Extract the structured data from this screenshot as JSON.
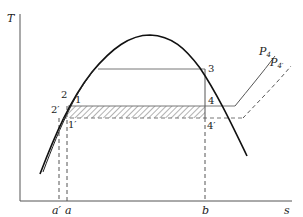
{
  "axes": {
    "y_label": "T",
    "x_label": "s",
    "x_ticks": [
      {
        "id": "a-prime",
        "label": "a′"
      },
      {
        "id": "a",
        "label": "a"
      },
      {
        "id": "b",
        "label": "b"
      }
    ]
  },
  "states": {
    "p1": "1",
    "p1p": "1′",
    "p2": "2",
    "p2p": "2′",
    "p3": "3",
    "p4": "4",
    "p4p": "4′"
  },
  "isobars": {
    "p4": {
      "base": "P",
      "sub": "4",
      "style": "solid"
    },
    "p4p": {
      "base": "P",
      "sub": "4′",
      "style": "dashed"
    }
  },
  "colors": {
    "dome": "#111111",
    "lines": "#555555",
    "hatch": "#666666"
  }
}
